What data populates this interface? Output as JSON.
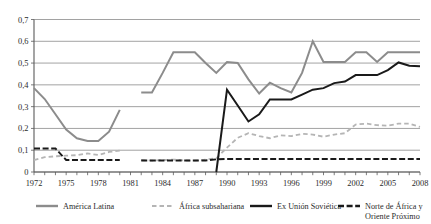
{
  "chart_data": {
    "type": "line",
    "title": "",
    "subtitle": "",
    "xlabel": "",
    "ylabel": "",
    "xlim": [
      1972,
      2008
    ],
    "ylim": [
      0,
      0.7
    ],
    "grid": true,
    "legend_position": "bottom",
    "y_ticks": [
      "0",
      "0,1",
      "0,2",
      "0,3",
      "0,4",
      "0,5",
      "0,6",
      "0,7"
    ],
    "y_tick_values": [
      0,
      0.1,
      0.2,
      0.3,
      0.4,
      0.5,
      0.6,
      0.7
    ],
    "x_ticks": [
      "1972",
      "1975",
      "1978",
      "1981",
      "1984",
      "1987",
      "1990",
      "1993",
      "1996",
      "1999",
      "2002",
      "2005",
      "2008"
    ],
    "x_tick_values": [
      1972,
      1975,
      1978,
      1981,
      1984,
      1987,
      1990,
      1993,
      1996,
      1999,
      2002,
      2005,
      2008
    ],
    "x_minor_ticks": [
      1972,
      1973,
      1974,
      1975,
      1976,
      1977,
      1978,
      1979,
      1980,
      1981,
      1982,
      1983,
      1984,
      1985,
      1986,
      1987,
      1988,
      1989,
      1990,
      1991,
      1992,
      1993,
      1994,
      1995,
      1996,
      1997,
      1998,
      1999,
      2000,
      2001,
      2002,
      2003,
      2004,
      2005,
      2006,
      2007,
      2008
    ],
    "series": [
      {
        "name": "América Latina",
        "color": "#8c8c8c",
        "style": "solid",
        "width": 2.0,
        "x": [
          1972,
          1973,
          1974,
          1975,
          1976,
          1977,
          1978,
          1979,
          1980,
          1982,
          1983,
          1984,
          1985,
          1986,
          1987,
          1988,
          1989,
          1990,
          1991,
          1992,
          1993,
          1994,
          1995,
          1996,
          1997,
          1998,
          1999,
          2000,
          2001,
          2002,
          2003,
          2004,
          2005,
          2006,
          2007,
          2008
        ],
        "values": [
          0.385,
          0.335,
          0.265,
          0.195,
          0.155,
          0.142,
          0.142,
          0.185,
          0.285,
          0.365,
          0.365,
          0.455,
          0.55,
          0.55,
          0.55,
          0.5,
          0.455,
          0.505,
          0.5,
          0.425,
          0.36,
          0.41,
          0.385,
          0.365,
          0.455,
          0.6,
          0.505,
          0.505,
          0.505,
          0.55,
          0.55,
          0.505,
          0.55,
          0.55,
          0.55,
          0.55
        ]
      },
      {
        "name": "África subsahariana",
        "color": "#b5b5b5",
        "style": "dashed",
        "width": 1.8,
        "x": [
          1972,
          1973,
          1974,
          1975,
          1976,
          1977,
          1978,
          1979,
          1980,
          1982,
          1983,
          1984,
          1985,
          1986,
          1987,
          1988,
          1989,
          1990,
          1991,
          1992,
          1993,
          1994,
          1995,
          1996,
          1997,
          1998,
          1999,
          2000,
          2001,
          2002,
          2003,
          2004,
          2005,
          2006,
          2007,
          2008
        ],
        "values": [
          0.055,
          0.068,
          0.072,
          0.075,
          0.077,
          0.085,
          0.078,
          0.092,
          0.098,
          0.055,
          0.052,
          0.055,
          0.057,
          0.053,
          0.052,
          0.057,
          0.063,
          0.112,
          0.157,
          0.178,
          0.165,
          0.155,
          0.168,
          0.165,
          0.175,
          0.172,
          0.162,
          0.172,
          0.178,
          0.218,
          0.222,
          0.215,
          0.213,
          0.222,
          0.222,
          0.207
        ]
      },
      {
        "name": "Ex Unión Soviética",
        "color": "#1a1a1a",
        "style": "solid",
        "width": 2.0,
        "x": [
          1989,
          1990,
          1991,
          1992,
          1993,
          1994,
          1995,
          1996,
          1997,
          1998,
          1999,
          2000,
          2001,
          2002,
          2003,
          2004,
          2005,
          2006,
          2007,
          2008
        ],
        "values": [
          0.0,
          0.378,
          0.305,
          0.232,
          0.265,
          0.333,
          0.333,
          0.333,
          0.355,
          0.378,
          0.385,
          0.408,
          0.415,
          0.445,
          0.445,
          0.445,
          0.468,
          0.503,
          0.488,
          0.485
        ]
      },
      {
        "name": "Norte de África y Oriente Próximo",
        "color": "#1a1a1a",
        "style": "dashed-long",
        "width": 1.9,
        "x": [
          1972,
          1973,
          1974,
          1975,
          1976,
          1977,
          1978,
          1979,
          1980,
          1982,
          1983,
          1984,
          1985,
          1986,
          1987,
          1988,
          1989,
          1990,
          1991,
          1992,
          1993,
          1994,
          1995,
          1996,
          1997,
          1998,
          1999,
          2000,
          2001,
          2002,
          2003,
          2004,
          2005,
          2006,
          2007,
          2008
        ],
        "values": [
          0.108,
          0.108,
          0.108,
          0.055,
          0.055,
          0.055,
          0.055,
          0.055,
          0.055,
          0.053,
          0.053,
          0.053,
          0.053,
          0.053,
          0.053,
          0.053,
          0.058,
          0.06,
          0.06,
          0.06,
          0.06,
          0.06,
          0.06,
          0.06,
          0.06,
          0.06,
          0.06,
          0.06,
          0.06,
          0.06,
          0.06,
          0.06,
          0.06,
          0.06,
          0.06,
          0.06
        ]
      }
    ]
  },
  "legend": {
    "items": [
      {
        "label": "América Latina",
        "label2": ""
      },
      {
        "label": "África subsahariana",
        "label2": ""
      },
      {
        "label": "Ex Unión Soviética",
        "label2": ""
      },
      {
        "label": "Norte de África y",
        "label2": "Oriente Próximo"
      }
    ]
  }
}
